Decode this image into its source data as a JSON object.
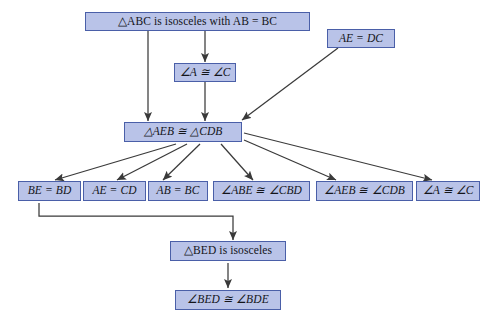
{
  "diagram": {
    "background_color": "#ffffff",
    "node_fill": "#b9c3e8",
    "node_border": "#4a5fa8",
    "edge_color": "#3a3a3a",
    "nodes": {
      "given_abc": "△ABC is isosceles with AB = BC",
      "angle_a_c_top": "∠A ≅ ∠C",
      "given_ae_dc": "AE = DC",
      "triangles_congruent": "△AEB ≅ △CDB",
      "be_bd": "BE = BD",
      "ae_cd": "AE = CD",
      "ab_bc": "AB = BC",
      "angle_abe_cbd": "∠ABE ≅ ∠CBD",
      "angle_aeb_cdb": "∠AEB ≅ ∠CDB",
      "angle_a_c_bottom": "∠A ≅ ∠C",
      "bed_isosceles": "△BED is isosceles",
      "angle_bed_bde": "∠BED ≅ ∠BDE"
    }
  }
}
